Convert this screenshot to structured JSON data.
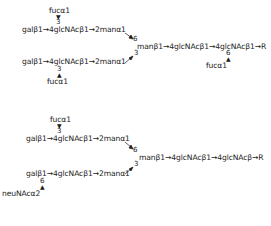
{
  "structure1": {
    "top_fuc": "fucα1",
    "top_fuc_link": "3",
    "upper_branch": "galβ1→4glcNAcβ1→2manα1",
    "upper_link": "6",
    "core": "manβ1→4glcNAcβ1→4glcNAcβ1→R",
    "core_fuc_link": "6",
    "core_fuc": "fucα1",
    "lower_link": "3",
    "lower_branch": "galβ1→4glcNAcβ1→2manα1",
    "bottom_fuc_link": "3",
    "bottom_fuc": "fucα1"
  },
  "structure2": {
    "top_fuc": "fucα1",
    "top_fuc_link": "3",
    "upper_branch": "galβ1→4glcNAcβ1→2manα1",
    "upper_link": "6",
    "core": "manβ1→4glcNAcβ1→4glcNAcβ→R",
    "lower_link": "3",
    "lower_branch": "galβ1→4glcNAcβ1→2manα1",
    "neu_link": "6",
    "neu": "neuNAcα2"
  }
}
